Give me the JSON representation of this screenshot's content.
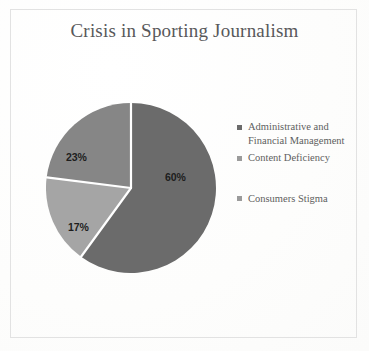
{
  "figure": {
    "title": "Crisis in Sporting Journalism",
    "frame_color": "#e2e2e2",
    "background_color": "#fefefe"
  },
  "chart_data": {
    "type": "pie",
    "title": "Crisis in Sporting Journalism",
    "xlabel": "",
    "ylabel": "",
    "categories": [
      "Administrative and Financial Management",
      "Content Deficiency",
      "Consumers Stigma"
    ],
    "values": [
      60,
      23,
      17
    ],
    "value_unit": "%",
    "data_labels": [
      "60%",
      "23%",
      "17%"
    ],
    "slice_colors": [
      "#6b6b6b",
      "#868686",
      "#a5a5a5"
    ],
    "separator_color": "#ffffff",
    "start_angle_deg": 0,
    "direction": "clockwise",
    "legend_position": "right",
    "grid": false,
    "slices": [
      {
        "name": "Administrative and Financial Management",
        "value": 60,
        "label": "60%",
        "color": "#6b6b6b"
      },
      {
        "name": "Content Deficiency",
        "value": 17,
        "label": "17%",
        "color": "#a5a5a5"
      },
      {
        "name": "Consumers Stigma",
        "value": 23,
        "label": "23%",
        "color": "#868686"
      }
    ]
  },
  "legend": {
    "items": [
      {
        "label": "Administrative and Financial Management",
        "color": "#6b6b6b"
      },
      {
        "label": "Content Deficiency",
        "color": "#9b9b9b"
      },
      {
        "label": "Consumers Stigma",
        "color": "#9b9b9b"
      }
    ]
  },
  "labels": {
    "slice_major": "60%",
    "slice_mid": "23%",
    "slice_minor": "17%"
  }
}
